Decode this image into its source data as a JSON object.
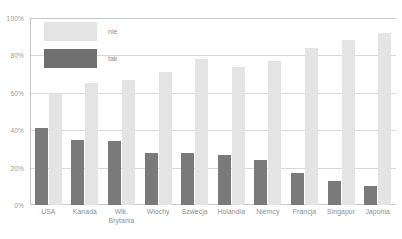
{
  "chart_data": {
    "type": "bar",
    "title": "",
    "xlabel": "",
    "ylabel": "",
    "ylim": [
      0,
      100
    ],
    "y_ticks": [
      0,
      20,
      40,
      60,
      80,
      100
    ],
    "y_tick_labels": [
      "0%",
      "20%",
      "40%",
      "60%",
      "80%",
      "100%"
    ],
    "grid": true,
    "legend_position": "top-left",
    "categories": [
      "USA",
      "Kanada",
      "Wlk. Brytania",
      "Włochy",
      "Szwecja",
      "Holandia",
      "Niemcy",
      "Francja",
      "Singapur",
      "Japonia"
    ],
    "category_lines": [
      [
        "USA"
      ],
      [
        "Kanada"
      ],
      [
        "Wlk.",
        "Brytania"
      ],
      [
        "Włochy"
      ],
      [
        "Szwecja"
      ],
      [
        "Holandia"
      ],
      [
        "Niemcy"
      ],
      [
        "Francja"
      ],
      [
        "Singapur"
      ],
      [
        "Japonia"
      ]
    ],
    "series": [
      {
        "name": "tak",
        "color": "#7a7a7a",
        "values": [
          41,
          35,
          34,
          28,
          28,
          27,
          24,
          17,
          13,
          10
        ]
      },
      {
        "name": "nie",
        "color": "#e4e4e4",
        "values": [
          60,
          65,
          67,
          71,
          78,
          74,
          77,
          84,
          88,
          92
        ]
      }
    ]
  },
  "legend": {
    "items": [
      {
        "label": "nie",
        "swatch": "nie"
      },
      {
        "label": "tak",
        "swatch": "tak"
      }
    ]
  },
  "colors": {
    "bar_tak": "#7a7a7a",
    "bar_nie": "#e4e4e4",
    "gridline": "#d8d8d8",
    "axis": "#c8c8c8",
    "text": "#8d8d8d",
    "background": "#ffffff"
  }
}
